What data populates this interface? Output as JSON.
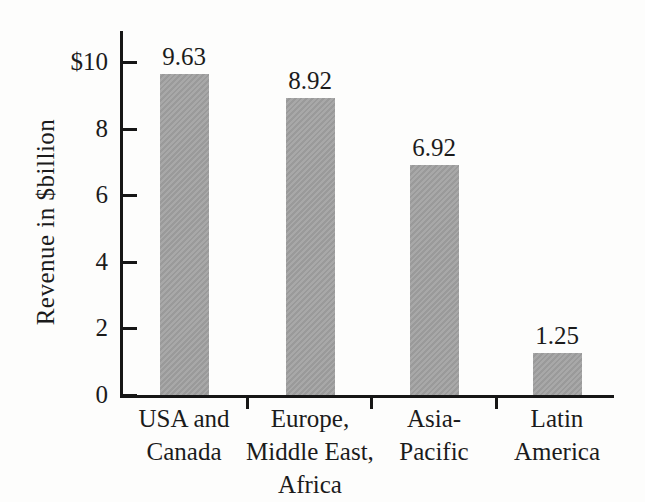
{
  "chart_data": {
    "type": "bar",
    "title": "",
    "xlabel": "",
    "ylabel": "Revenue in $billion",
    "ylim": [
      0,
      10.9
    ],
    "grid": false,
    "legend": "none",
    "bar_color": "#a1a1a1",
    "axis_color": "#161616",
    "y_ticks": [
      {
        "value": 10,
        "label": "$10"
      },
      {
        "value": 8,
        "label": "8"
      },
      {
        "value": 6,
        "label": "6"
      },
      {
        "value": 4,
        "label": "4"
      },
      {
        "value": 2,
        "label": "2"
      },
      {
        "value": 0,
        "label": "0"
      }
    ],
    "categories": [
      "USA and Canada",
      "Europe, Middle East, Africa",
      "Asia-Pacific",
      "Latin America"
    ],
    "category_label_lines": [
      [
        "USA and",
        "Canada"
      ],
      [
        "Europe,",
        "Middle East,",
        "Africa"
      ],
      [
        "Asia-",
        "Pacific"
      ],
      [
        "Latin",
        "America"
      ]
    ],
    "values": [
      9.63,
      8.92,
      6.92,
      1.25
    ],
    "value_labels": [
      "9.63",
      "8.92",
      "6.92",
      "1.25"
    ]
  }
}
